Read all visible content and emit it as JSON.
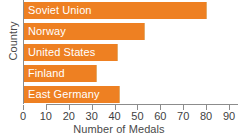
{
  "chart_data": {
    "type": "bar",
    "orientation": "horizontal",
    "title": "",
    "xlabel": "Number of Medals",
    "ylabel": "Country",
    "categories": [
      "Soviet Union",
      "Norway",
      "United States",
      "Finland",
      "East Germany"
    ],
    "values": [
      80,
      53,
      41,
      32,
      42
    ],
    "xlim": [
      0,
      90
    ],
    "xticks": [
      0,
      10,
      20,
      30,
      40,
      50,
      60,
      70,
      80,
      90
    ],
    "xtick_labels": [
      "0",
      "10",
      "20",
      "30",
      "40",
      "50",
      "60",
      "70",
      "80",
      "90"
    ],
    "grid": false,
    "legend": null,
    "bar_color": "#ee8022",
    "bar_label_color": "#ffffff",
    "axis_color": "#8c8c8c"
  }
}
